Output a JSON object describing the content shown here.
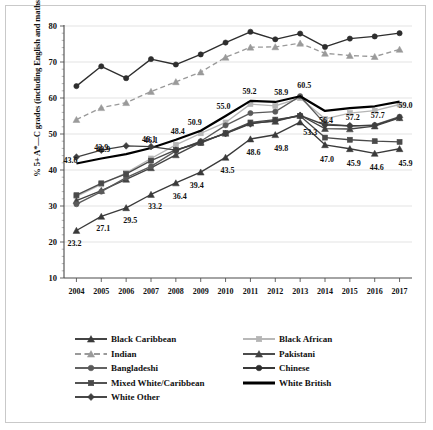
{
  "chart_data": {
    "type": "line",
    "title": "",
    "xlabel": "",
    "ylabel": "% 5+ A*—C grades (including English and maths)",
    "categories": [
      "2004",
      "2005",
      "2006",
      "2007",
      "2008",
      "2009",
      "2010",
      "2011",
      "2012",
      "2013",
      "2014",
      "2015",
      "2016",
      "2017"
    ],
    "x": [
      2004,
      2005,
      2006,
      2007,
      2008,
      2009,
      2010,
      2011,
      2012,
      2013,
      2014,
      2015,
      2016,
      2017
    ],
    "ylim": [
      10,
      80
    ],
    "yticks": [
      10,
      20,
      30,
      40,
      50,
      60,
      70,
      80
    ],
    "grid": true,
    "legend_position": "bottom",
    "series": [
      {
        "name": "Black Caribbean",
        "color": "#3a3a3a",
        "marker": "triangle",
        "dash": false,
        "values": [
          23.2,
          27.1,
          29.5,
          33.2,
          36.4,
          39.4,
          43.5,
          48.6,
          49.8,
          53.3,
          47.0,
          45.9,
          44.6,
          45.9
        ],
        "labels": [
          "23.2",
          "27.1",
          "29.5",
          "33.2",
          "36.4",
          "39.4",
          "43.5",
          "48.6",
          "49.8",
          "53.3",
          "47.0",
          "45.9",
          "44.6",
          "45.9"
        ]
      },
      {
        "name": "Black African",
        "color": "#b5b5b5",
        "marker": "square",
        "dash": false,
        "values": [
          32.7,
          36.0,
          39.2,
          43.2,
          47.0,
          50.2,
          53.2,
          58.3,
          57.8,
          60.0,
          54.2,
          55.8,
          56.5,
          58.2
        ],
        "labels": []
      },
      {
        "name": "Indian",
        "color": "#9a9a9a",
        "marker": "triangle",
        "dash": true,
        "values": [
          54.0,
          57.3,
          58.7,
          61.8,
          64.5,
          67.2,
          71.3,
          74.1,
          74.2,
          75.2,
          72.4,
          71.8,
          71.5,
          73.5
        ],
        "labels": []
      },
      {
        "name": "Pakistani",
        "color": "#434343",
        "marker": "triangle",
        "dash": false,
        "values": [
          31.5,
          34.3,
          37.4,
          40.6,
          44.2,
          47.7,
          50.2,
          53.0,
          53.5,
          55.2,
          51.5,
          51.4,
          52.2,
          54.5
        ],
        "labels": []
      },
      {
        "name": "Bangladeshi",
        "color": "#5a5a5a",
        "marker": "circle",
        "dash": false,
        "values": [
          30.5,
          34.0,
          37.9,
          41.0,
          45.3,
          48.0,
          52.4,
          55.8,
          56.2,
          60.5,
          52.8,
          52.2,
          52.5,
          54.8
        ],
        "labels": []
      },
      {
        "name": "Chinese",
        "color": "#2e2e2e",
        "marker": "circle",
        "dash": false,
        "values": [
          63.3,
          68.8,
          65.5,
          70.8,
          69.3,
          72.1,
          75.4,
          78.4,
          76.3,
          77.9,
          74.2,
          76.5,
          77.1,
          78.0
        ],
        "labels": []
      },
      {
        "name": "Mixed White/Caribbean",
        "color": "#4a4a4a",
        "marker": "square",
        "dash": false,
        "values": [
          33.0,
          36.3,
          38.9,
          42.6,
          45.6,
          47.5,
          50.3,
          53.2,
          54.0,
          55.0,
          49.0,
          48.4,
          48.0,
          47.8
        ],
        "labels": []
      },
      {
        "name": "White British",
        "color": "#000000",
        "marker": "none",
        "dash": false,
        "width": 2.2,
        "values": [
          41.8,
          43.2,
          44.4,
          46.1,
          48.4,
          50.9,
          55.0,
          59.2,
          58.9,
          60.5,
          56.4,
          57.2,
          57.7,
          59.0
        ],
        "labels": [
          "",
          "",
          "",
          "46.1",
          "48.4",
          "50.9",
          "55.0",
          "59.2",
          "58.9",
          "60.5",
          "56.4",
          "57.2",
          "57.7",
          "59.0"
        ]
      },
      {
        "name": "White Other",
        "color": "#3f3f3f",
        "marker": "diamond",
        "dash": false,
        "values": [
          43.6,
          45.5,
          46.7,
          46.5,
          45.5,
          47.8,
          50.1,
          52.8,
          53.7,
          55.2,
          52.5,
          52.3,
          52.4,
          54.6
        ],
        "labels": [
          "43.6",
          "42.9",
          "",
          "",
          "",
          "",
          "",
          "",
          "",
          "",
          "",
          "",
          "",
          ""
        ]
      }
    ],
    "extra_labels": [
      {
        "text": "42.9",
        "x": 2005,
        "y": 45.5
      },
      {
        "text": "46.1",
        "x": 2007,
        "y": 47.6
      }
    ]
  },
  "legend": {
    "column_left": [
      {
        "label": "Black Caribbean",
        "marker": "triangle",
        "dash": false,
        "color": "#3a3a3a"
      },
      {
        "label": "Indian",
        "marker": "triangle",
        "dash": true,
        "color": "#9a9a9a"
      },
      {
        "label": "Bangladeshi",
        "marker": "circle",
        "dash": false,
        "color": "#5a5a5a"
      },
      {
        "label": "Mixed White/Caribbean",
        "marker": "square",
        "dash": false,
        "color": "#4a4a4a"
      },
      {
        "label": "White Other",
        "marker": "diamond",
        "dash": false,
        "color": "#3f3f3f"
      }
    ],
    "column_right": [
      {
        "label": "Black African",
        "marker": "square",
        "dash": false,
        "color": "#b5b5b5"
      },
      {
        "label": "Pakistani",
        "marker": "triangle",
        "dash": false,
        "color": "#434343"
      },
      {
        "label": "Chinese",
        "marker": "circle",
        "dash": false,
        "color": "#2e2e2e"
      },
      {
        "label": "White British",
        "marker": "none",
        "dash": false,
        "color": "#000000"
      }
    ]
  }
}
